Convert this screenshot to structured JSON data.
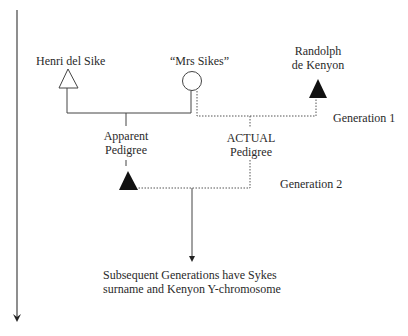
{
  "diagram": {
    "type": "pedigree",
    "individuals": [
      {
        "id": "henri",
        "name": "Henri del Sike",
        "symbol": "open-triangle",
        "sex": "male",
        "generation": 1
      },
      {
        "id": "mrs_sikes",
        "name": "“Mrs Sikes”",
        "symbol": "open-circle",
        "sex": "female",
        "generation": 1
      },
      {
        "id": "randolph",
        "name_line1": "Randolph",
        "name_line2": "de Kenyon",
        "symbol": "filled-triangle",
        "sex": "male",
        "generation": 1
      },
      {
        "id": "child",
        "name": "",
        "symbol": "filled-triangle",
        "sex": "male",
        "generation": 2
      }
    ],
    "links": [
      {
        "from": "henri",
        "to": "mrs_sikes",
        "style": "solid",
        "label_line1": "Apparent",
        "label_line2": "Pedigree"
      },
      {
        "from": "mrs_sikes",
        "to": "randolph",
        "style": "dotted",
        "label_line1": "ACTUAL",
        "label_line2": "Pedigree"
      }
    ],
    "generation_labels": {
      "gen1": "Generation 1",
      "gen2": "Generation 2"
    },
    "footer": {
      "line1": "Subsequent Generations have Sykes",
      "line2": "surname and Kenyon Y-chromosome"
    },
    "time_axis": {
      "direction": "down"
    },
    "colors": {
      "line": "#3a3a3a",
      "fill": "#111111",
      "background": "#ffffff"
    }
  }
}
